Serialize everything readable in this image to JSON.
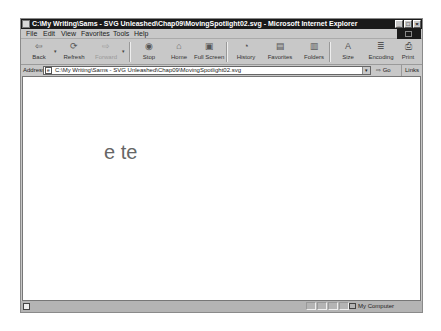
{
  "window": {
    "title": "C:\\My Writing\\Sams - SVG Unleashed\\Chap09\\MovingSpotlight02.svg - Microsoft Internet Explorer",
    "controls": {
      "minimize": "_",
      "maximize": "□",
      "close": "×"
    }
  },
  "menubar": {
    "items": [
      {
        "label": "File"
      },
      {
        "label": "Edit"
      },
      {
        "label": "View"
      },
      {
        "label": "Favorites"
      },
      {
        "label": "Tools"
      },
      {
        "label": "Help"
      }
    ]
  },
  "toolbar": {
    "buttons": [
      {
        "label": "Back",
        "icon": "back-arrow-icon",
        "glyph": "⇦"
      },
      {
        "label": "Refresh",
        "icon": "refresh-icon",
        "glyph": "⟳"
      },
      {
        "label": "Forward",
        "icon": "forward-arrow-icon",
        "glyph": "⇨"
      },
      {
        "label": "Stop",
        "icon": "stop-icon",
        "glyph": "◉"
      },
      {
        "label": "Home",
        "icon": "home-icon",
        "glyph": "⌂"
      },
      {
        "label": "Full Screen",
        "icon": "fullscreen-icon",
        "glyph": "▣"
      },
      {
        "label": "History",
        "icon": "history-icon",
        "glyph": "◔"
      },
      {
        "label": "Favorites",
        "icon": "favorites-icon",
        "glyph": "▤"
      },
      {
        "label": "Folders",
        "icon": "folders-icon",
        "glyph": "▥"
      },
      {
        "label": "Size",
        "icon": "text-size-icon",
        "glyph": "A"
      },
      {
        "label": "Encoding",
        "icon": "encoding-icon",
        "glyph": "≣"
      },
      {
        "label": "Print",
        "icon": "print-icon",
        "glyph": "⎙"
      }
    ],
    "dropdown_glyph": "▾"
  },
  "addressbar": {
    "label": "Address",
    "value": "C:\\My Writing\\Sams - SVG Unleashed\\Chap09\\MovingSpotlight02.svg",
    "go_label": "Go",
    "go_glyph": "⇨",
    "links_label": "Links »"
  },
  "content": {
    "visible_text": "e te"
  },
  "statusbar": {
    "zone": "My Computer"
  }
}
